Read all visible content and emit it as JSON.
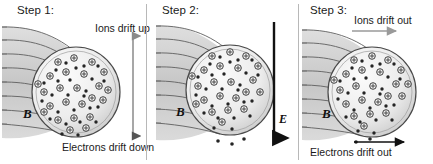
{
  "figure": {
    "background": "#ffffff",
    "particles": {
      "ion_symbol": "+",
      "ion_name": "ion-particle",
      "electron_name": "electron-particle",
      "ion_fill": "#f2f2f2",
      "ion_stroke": "#2b2b2b",
      "electron_fill": "#2b2b2b"
    },
    "field_color": "#5a5a5a",
    "sphere_fill": "#e9e9e9",
    "sphere_stroke": "#4a4a4a",
    "arrow_dark": "#111111",
    "arrow_gray": "#8a8a8a"
  },
  "panels": [
    {
      "id": "step-1",
      "step_label": "Step 1:",
      "b_label": "B",
      "top_caption": "Ions drift up",
      "bottom_caption": "Electrons drift down",
      "arrow": {
        "kind": "double-headed-vertical",
        "color": "#8a8a8a",
        "up_meaning": "Ions drift up",
        "down_meaning": "Electrons drift down"
      },
      "e_label": null
    },
    {
      "id": "step-2",
      "step_label": "Step 2:",
      "b_label": "B",
      "top_caption": "",
      "bottom_caption": "",
      "arrow": {
        "kind": "single-headed-vertical-down",
        "color": "#111111",
        "down_meaning": "Electric field E points down"
      },
      "e_label": "E"
    },
    {
      "id": "step-3",
      "step_label": "Step 3:",
      "b_label": "B",
      "top_caption": "Ions drift out",
      "bottom_caption": "Electrons drift out",
      "arrow": {
        "kind": "two-horizontal-right",
        "top_color": "#9a9a9a",
        "bottom_color": "#111111",
        "right_meaning": "Both species drift outward to the right"
      },
      "e_label": null
    }
  ]
}
